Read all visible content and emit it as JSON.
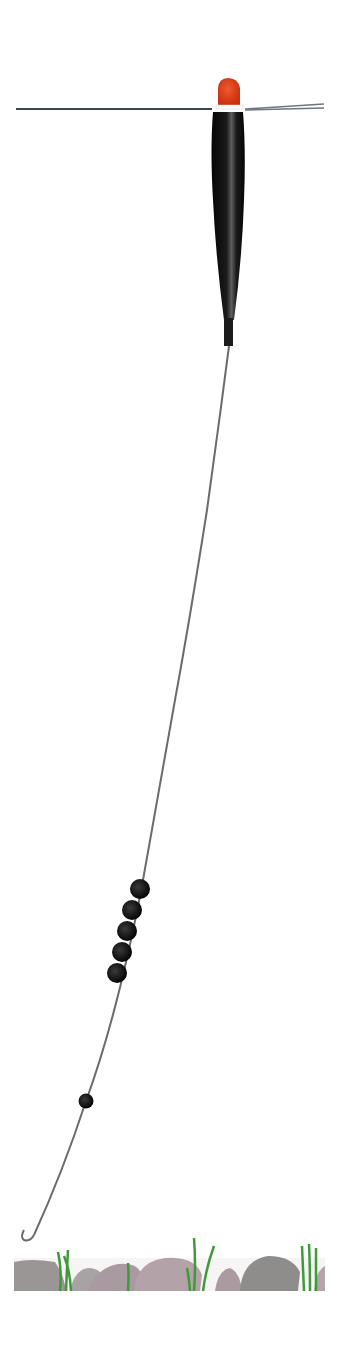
{
  "components": {
    "surface_line": "water-surface",
    "float": {
      "tip_color": "#e0401e",
      "body_color": "#111111",
      "highlight_color": "#6a6a6a"
    },
    "main_line": {
      "color": "#6b6b6b"
    },
    "bulk_shot": {
      "count": 5,
      "color": "#0d0d0d"
    },
    "dropper_shot": {
      "count": 1,
      "color": "#0d0d0d"
    },
    "hook": {
      "color": "#6b6b6b"
    },
    "lakebed": {
      "stone_colors": [
        "#9a9696",
        "#a89aa0",
        "#b5a5ab",
        "#8f8c8c"
      ],
      "weed_color": "#3f9a3c"
    }
  }
}
